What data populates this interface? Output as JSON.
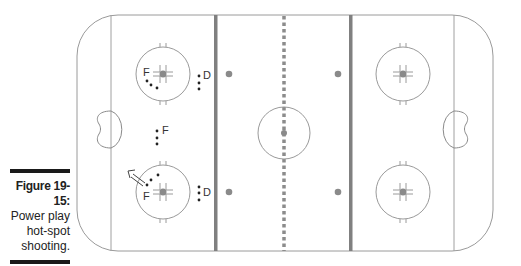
{
  "caption": {
    "figure_label": "Figure 19-15:",
    "lines": [
      "Power play",
      "hot-spot",
      "shooting."
    ]
  },
  "diagram": {
    "title": "Power play hot-spot shooting",
    "colors": {
      "boards": "#9a9a9a",
      "blue_line": "#808080",
      "red_line": "#8c8c8c",
      "dot": "#8a8a8a",
      "player": "#222222",
      "caption_bar": "#1a1a1a"
    },
    "players": [
      {
        "label": "F",
        "position": "top-left faceoff circle"
      },
      {
        "label": "D",
        "position": "top point"
      },
      {
        "label": "F",
        "position": "slot"
      },
      {
        "label": "F",
        "position": "bottom-left faceoff circle"
      },
      {
        "label": "D",
        "position": "bottom point"
      }
    ],
    "labels": {
      "forward": "F",
      "defense": "D"
    }
  }
}
